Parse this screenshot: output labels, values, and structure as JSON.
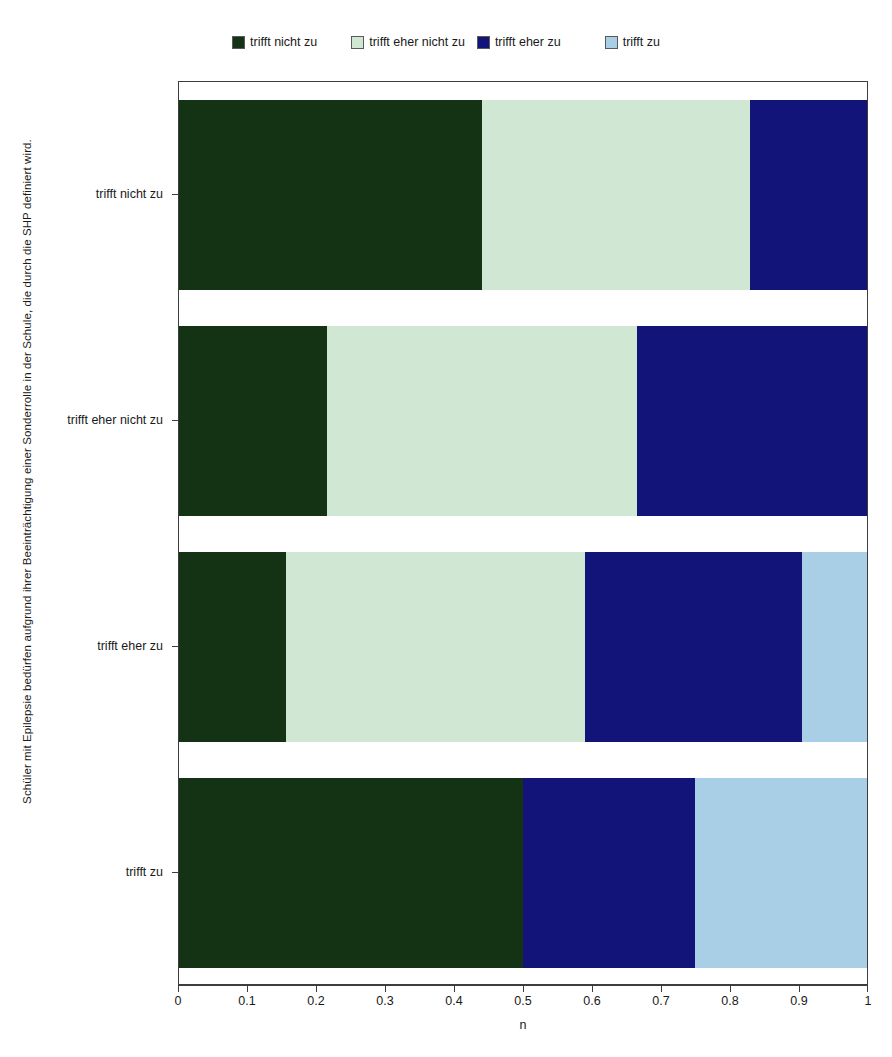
{
  "legend": {
    "position": "top",
    "items": [
      {
        "label": "trifft nicht zu",
        "color": "#143314"
      },
      {
        "label": "trifft eher nicht zu",
        "color": "#cfe7d3"
      },
      {
        "label": "trifft eher zu",
        "color": "#13147a"
      },
      {
        "label": "trifft zu",
        "color": "#a9cfe6"
      }
    ]
  },
  "axes": {
    "y_title": "Schüler mit Epilepsie bedürfen aufgrund ihrer Beeinträchtigung einer Sonderrolle in der Schule, die durch die SHP definiert wird.",
    "x_title": "n",
    "x_ticks": [
      "0",
      "0.1",
      "0.2",
      "0.3",
      "0.4",
      "0.5",
      "0.6",
      "0.7",
      "0.8",
      "0.9",
      "1"
    ],
    "x_min": 0,
    "x_max": 1,
    "y_categories": [
      "trifft nicht zu",
      "trifft eher nicht zu",
      "trifft eher zu",
      "trifft zu"
    ]
  },
  "chart_data": {
    "type": "bar",
    "orientation": "horizontal",
    "stacked": true,
    "normalized": true,
    "title": "",
    "subtitle": "",
    "xlabel": "n",
    "ylabel": "Schüler mit Epilepsie bedürfen aufgrund ihrer Beeinträchtigung einer Sonderrolle in der Schule, die durch die SHP definiert wird.",
    "xlim": [
      0,
      1
    ],
    "grid": false,
    "legend_position": "top",
    "categories": [
      "trifft nicht zu",
      "trifft eher nicht zu",
      "trifft eher zu",
      "trifft zu"
    ],
    "series": [
      {
        "name": "trifft nicht zu",
        "color": "#143314",
        "values": [
          0.44,
          0.215,
          0.155,
          0.5
        ]
      },
      {
        "name": "trifft eher nicht zu",
        "color": "#cfe7d3",
        "values": [
          0.39,
          0.45,
          0.435,
          0.0
        ]
      },
      {
        "name": "trifft eher zu",
        "color": "#13147a",
        "values": [
          0.17,
          0.335,
          0.315,
          0.25
        ]
      },
      {
        "name": "trifft zu",
        "color": "#a9cfe6",
        "values": [
          0.0,
          0.0,
          0.095,
          0.25
        ]
      }
    ]
  }
}
